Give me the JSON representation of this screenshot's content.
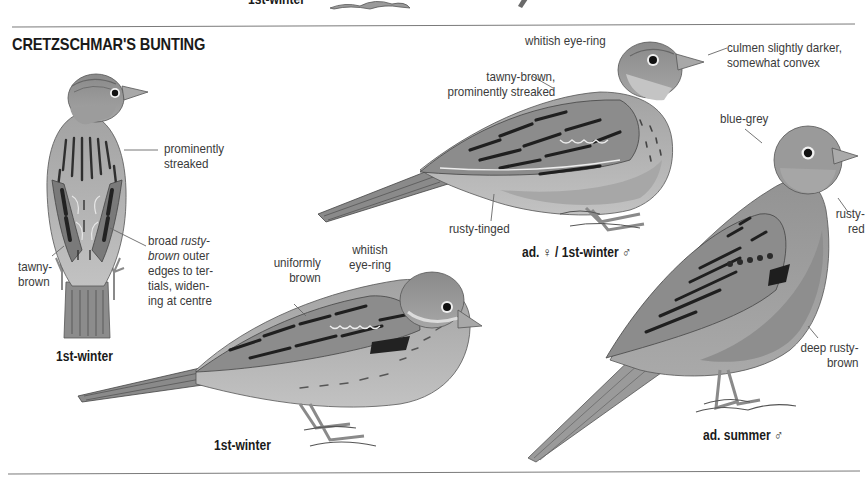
{
  "page": {
    "previous_section_caption": "1st-winter",
    "species_title": "CRETZSCHMAR'S BUNTING"
  },
  "figures": [
    {
      "id": "back-view",
      "caption": "1st-winter",
      "annotations": [
        {
          "text_lines": [
            "prominently",
            "streaked"
          ]
        },
        {
          "text_lines": [
            "broad ",
            "rusty-",
            "brown",
            " outer",
            "edges to ter-",
            "tials, widen-",
            "ing at centre"
          ],
          "italic_terms": [
            "rusty-",
            "brown"
          ]
        },
        {
          "text_lines": [
            "tawny-",
            "brown"
          ]
        }
      ]
    },
    {
      "id": "adult-female",
      "caption_prefix": "ad.",
      "caption_female_symbol": "♀",
      "caption_mid": "/ 1st-winter",
      "caption_male_symbol": "♂",
      "annotations": [
        {
          "text_lines": [
            "whitish eye-ring"
          ]
        },
        {
          "text_lines": [
            "culmen slightly darker,",
            "somewhat convex"
          ]
        },
        {
          "text_lines": [
            "tawny-brown,",
            "prominently streaked"
          ]
        },
        {
          "text_lines": [
            "rusty-tinged"
          ]
        }
      ]
    },
    {
      "id": "first-winter-side",
      "caption": "1st-winter",
      "annotations": [
        {
          "text_lines": [
            "uniformly",
            "brown"
          ]
        },
        {
          "text_lines": [
            "whitish",
            "eye-ring"
          ]
        }
      ]
    },
    {
      "id": "adult-summer-male",
      "caption_prefix": "ad. summer",
      "caption_male_symbol": "♂",
      "annotations": [
        {
          "text_lines": [
            "blue-grey"
          ]
        },
        {
          "text_lines": [
            "rusty-",
            "red"
          ]
        },
        {
          "text_lines": [
            "deep rusty-",
            "brown"
          ]
        }
      ]
    }
  ],
  "colors": {
    "rule": "#7a7a7a",
    "text": "#2a2a2a",
    "caption": "#1a1a1a",
    "plumage_light": "#b4b4b4",
    "plumage_mid": "#8e8e8e",
    "plumage_dark": "#3c3c3c"
  }
}
